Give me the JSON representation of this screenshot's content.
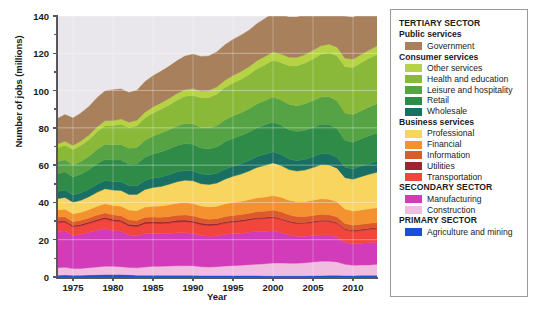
{
  "chart_data": {
    "type": "area",
    "title": "",
    "xlabel": "Year",
    "ylabel": "Number of jobs (millions)",
    "xlim": [
      1973,
      2013
    ],
    "ylim": [
      0,
      140
    ],
    "grid": true,
    "stacked": true,
    "legend_position": "right",
    "y_ticks": [
      0,
      20,
      40,
      60,
      80,
      100,
      120,
      140
    ],
    "y_tick_labels": [
      "0",
      "20",
      "40",
      "60",
      "80",
      "100",
      "120",
      "140"
    ],
    "x_ticks": [
      1975,
      1980,
      1985,
      1990,
      1995,
      2000,
      2005,
      2010
    ],
    "x_tick_labels": [
      "1975",
      "1980",
      "1985",
      "1990",
      "1995",
      "2000",
      "2005",
      "2010"
    ],
    "x": [
      1973,
      1974,
      1975,
      1976,
      1977,
      1978,
      1979,
      1980,
      1981,
      1982,
      1983,
      1984,
      1985,
      1986,
      1987,
      1988,
      1989,
      1990,
      1991,
      1992,
      1993,
      1994,
      1995,
      1996,
      1997,
      1998,
      1999,
      2000,
      2001,
      2002,
      2003,
      2004,
      2005,
      2006,
      2007,
      2008,
      2009,
      2010,
      2011,
      2012,
      2013
    ],
    "stack_order_bottom_to_top": [
      "Agriculture and mining",
      "Construction",
      "Manufacturing",
      "Transportation",
      "Utilities",
      "Information",
      "Financial",
      "Professional",
      "Wholesale",
      "Retail",
      "Leisure and hospitality",
      "Health and education",
      "Other services",
      "Government"
    ],
    "series": [
      {
        "name": "Agriculture and mining",
        "color": "#1c50d2",
        "values": [
          1.0,
          1.1,
          1.0,
          1.0,
          1.1,
          1.2,
          1.3,
          1.3,
          1.3,
          1.2,
          1.0,
          1.0,
          1.0,
          0.9,
          0.9,
          0.9,
          0.9,
          0.9,
          0.8,
          0.8,
          0.8,
          0.8,
          0.8,
          0.8,
          0.8,
          0.8,
          0.7,
          0.7,
          0.7,
          0.7,
          0.7,
          0.7,
          0.8,
          0.8,
          0.9,
          0.9,
          0.8,
          0.8,
          0.9,
          0.9,
          0.9
        ]
      },
      {
        "name": "Construction",
        "color": "#f0bde0",
        "values": [
          4.0,
          4.1,
          3.5,
          3.6,
          3.9,
          4.2,
          4.5,
          4.4,
          4.2,
          3.9,
          3.9,
          4.4,
          4.7,
          4.8,
          5.0,
          5.1,
          5.2,
          5.1,
          4.7,
          4.5,
          4.7,
          5.1,
          5.3,
          5.5,
          5.8,
          6.1,
          6.4,
          6.8,
          6.8,
          6.7,
          6.7,
          6.9,
          7.3,
          7.7,
          7.6,
          7.2,
          6.0,
          5.5,
          5.5,
          5.6,
          5.9
        ]
      },
      {
        "name": "Manufacturing",
        "color": "#d23bba",
        "values": [
          19.4,
          19.5,
          17.8,
          18.3,
          19.0,
          19.7,
          20.2,
          19.3,
          19.0,
          17.4,
          17.2,
          18.0,
          17.8,
          17.5,
          17.5,
          17.8,
          17.8,
          17.4,
          16.8,
          16.5,
          16.6,
          17.0,
          17.2,
          17.2,
          17.4,
          17.6,
          17.3,
          17.3,
          16.4,
          15.3,
          14.5,
          14.3,
          14.2,
          14.2,
          14.0,
          13.4,
          11.8,
          11.5,
          11.7,
          11.9,
          12.0
        ]
      },
      {
        "name": "Transportation",
        "color": "#f2463c",
        "values": [
          4.7,
          4.7,
          4.5,
          4.6,
          4.7,
          4.9,
          5.1,
          5.1,
          5.1,
          4.9,
          4.9,
          5.2,
          5.3,
          5.4,
          5.5,
          5.7,
          5.8,
          5.8,
          5.7,
          5.7,
          5.8,
          6.0,
          6.1,
          6.3,
          6.5,
          6.7,
          6.9,
          7.0,
          6.9,
          6.7,
          6.7,
          6.8,
          7.0,
          7.2,
          7.3,
          7.2,
          6.7,
          6.7,
          6.9,
          7.1,
          7.2
        ]
      },
      {
        "name": "Utilities",
        "color": "#9e2430",
        "values": [
          0.8,
          0.8,
          0.8,
          0.8,
          0.8,
          0.9,
          0.9,
          0.9,
          0.9,
          0.9,
          0.9,
          0.9,
          0.9,
          0.9,
          0.9,
          0.9,
          0.9,
          0.9,
          0.9,
          0.9,
          0.8,
          0.8,
          0.8,
          0.8,
          0.7,
          0.7,
          0.7,
          0.6,
          0.6,
          0.6,
          0.6,
          0.6,
          0.6,
          0.6,
          0.6,
          0.6,
          0.6,
          0.6,
          0.6,
          0.6,
          0.6
        ]
      },
      {
        "name": "Information",
        "color": "#dd5a2c",
        "values": [
          2.1,
          2.1,
          2.1,
          2.1,
          2.2,
          2.3,
          2.4,
          2.4,
          2.4,
          2.4,
          2.4,
          2.5,
          2.5,
          2.5,
          2.6,
          2.7,
          2.7,
          2.7,
          2.7,
          2.6,
          2.6,
          2.7,
          2.8,
          2.9,
          3.0,
          3.2,
          3.3,
          3.6,
          3.6,
          3.4,
          3.2,
          3.1,
          3.1,
          3.1,
          3.0,
          3.0,
          2.8,
          2.7,
          2.7,
          2.7,
          2.7
        ]
      },
      {
        "name": "Financial",
        "color": "#f4922f",
        "values": [
          4.0,
          4.1,
          4.2,
          4.3,
          4.5,
          4.7,
          4.9,
          5.0,
          5.1,
          5.2,
          5.3,
          5.5,
          5.8,
          6.1,
          6.3,
          6.5,
          6.6,
          6.6,
          6.5,
          6.6,
          6.7,
          6.9,
          7.0,
          7.1,
          7.2,
          7.4,
          7.6,
          7.7,
          7.8,
          7.8,
          8.0,
          8.0,
          8.2,
          8.4,
          8.3,
          8.1,
          7.8,
          7.6,
          7.7,
          7.8,
          7.9
        ]
      },
      {
        "name": "Professional",
        "color": "#f8d55e",
        "values": [
          6.0,
          6.3,
          6.2,
          6.5,
          6.9,
          7.5,
          8.0,
          8.2,
          8.4,
          8.4,
          8.7,
          9.4,
          10.0,
          10.5,
          11.0,
          11.5,
          12.0,
          12.2,
          11.9,
          12.0,
          12.4,
          13.2,
          14.0,
          14.6,
          15.4,
          16.3,
          17.0,
          17.5,
          17.0,
          16.4,
          16.4,
          17.0,
          17.5,
          18.2,
          18.4,
          18.0,
          16.8,
          17.0,
          17.8,
          18.5,
          19.0
        ]
      },
      {
        "name": "Wholesale",
        "color": "#1a6f63",
        "values": [
          3.9,
          4.0,
          3.9,
          4.0,
          4.1,
          4.3,
          4.5,
          4.6,
          4.7,
          4.6,
          4.6,
          4.8,
          5.0,
          5.1,
          5.2,
          5.3,
          5.4,
          5.3,
          5.2,
          5.2,
          5.2,
          5.3,
          5.4,
          5.5,
          5.7,
          5.8,
          5.9,
          6.0,
          5.9,
          5.7,
          5.6,
          5.7,
          5.8,
          5.9,
          6.0,
          5.9,
          5.6,
          5.5,
          5.7,
          5.8,
          5.9
        ]
      },
      {
        "name": "Retail",
        "color": "#2f8c48",
        "values": [
          9.5,
          9.7,
          9.6,
          10.0,
          10.4,
          11.0,
          11.4,
          11.5,
          11.6,
          11.6,
          11.9,
          12.5,
          13.0,
          13.5,
          13.8,
          14.1,
          14.3,
          14.3,
          14.0,
          13.9,
          14.2,
          14.7,
          15.0,
          15.2,
          15.3,
          15.5,
          15.8,
          16.0,
          15.8,
          15.7,
          15.6,
          15.6,
          15.7,
          15.8,
          15.7,
          15.3,
          14.5,
          14.4,
          14.6,
          14.8,
          15.0
        ]
      },
      {
        "name": "Leisure and hospitality",
        "color": "#55a344",
        "values": [
          6.3,
          6.5,
          6.6,
          6.9,
          7.2,
          7.7,
          8.0,
          8.2,
          8.4,
          8.5,
          8.8,
          9.2,
          9.6,
          10.0,
          10.3,
          10.5,
          10.8,
          11.0,
          11.0,
          11.2,
          11.5,
          11.8,
          12.1,
          12.2,
          12.5,
          12.8,
          13.1,
          13.4,
          13.5,
          13.6,
          13.9,
          14.2,
          14.5,
          14.7,
          15.0,
          14.9,
          14.6,
          14.8,
          15.1,
          15.5,
          15.8
        ]
      },
      {
        "name": "Health and education",
        "color": "#8ab93a",
        "values": [
          7.5,
          7.8,
          8.2,
          8.6,
          9.0,
          9.5,
          10.0,
          10.4,
          10.8,
          11.2,
          11.6,
          12.0,
          12.4,
          12.9,
          13.3,
          13.9,
          14.5,
          15.2,
          15.9,
          16.4,
          16.9,
          17.3,
          17.6,
          18.0,
          18.3,
          18.8,
          19.2,
          19.6,
          20.1,
          20.8,
          21.4,
          21.9,
          22.3,
          22.9,
          23.5,
          24.2,
          24.8,
          25.3,
          25.7,
          26.1,
          26.5
        ]
      },
      {
        "name": "Other services",
        "color": "#b6d344",
        "values": [
          2.0,
          2.1,
          2.2,
          2.3,
          2.4,
          2.5,
          2.6,
          2.7,
          2.8,
          2.8,
          2.9,
          3.0,
          3.2,
          3.3,
          3.4,
          3.5,
          3.6,
          3.7,
          3.7,
          3.7,
          3.8,
          3.9,
          4.0,
          4.1,
          4.2,
          4.3,
          4.4,
          4.5,
          4.5,
          4.5,
          4.5,
          4.5,
          4.6,
          4.6,
          4.6,
          4.6,
          4.5,
          4.4,
          4.4,
          4.4,
          4.5
        ]
      },
      {
        "name": "Government",
        "color": "#a8805c",
        "values": [
          13.7,
          14.3,
          14.7,
          15.0,
          15.3,
          15.8,
          16.0,
          16.4,
          16.2,
          16.0,
          16.1,
          16.4,
          16.7,
          17.0,
          17.3,
          17.6,
          18.0,
          18.4,
          18.5,
          18.6,
          18.8,
          19.1,
          19.3,
          19.5,
          19.6,
          19.9,
          20.3,
          20.8,
          21.1,
          21.5,
          21.6,
          21.6,
          21.8,
          22.0,
          22.2,
          22.5,
          22.5,
          22.5,
          22.1,
          21.9,
          21.9
        ]
      }
    ]
  },
  "axes": {
    "y_title": "Number of jobs (millions)",
    "x_title": "Year"
  },
  "legend": {
    "groups": [
      {
        "title": "TERTIARY SECTOR",
        "subgroups": [
          {
            "title": "Public services",
            "items": [
              {
                "label": "Government",
                "color": "#a8805c"
              }
            ]
          },
          {
            "title": "Consumer services",
            "items": [
              {
                "label": "Other services",
                "color": "#b6d344"
              },
              {
                "label": "Health and education",
                "color": "#8ab93a"
              },
              {
                "label": "Leisure and hospitality",
                "color": "#55a344"
              },
              {
                "label": "Retail",
                "color": "#2f8c48"
              },
              {
                "label": "Wholesale",
                "color": "#1a6f63"
              }
            ]
          },
          {
            "title": "Business services",
            "items": [
              {
                "label": "Professional",
                "color": "#f8d55e"
              },
              {
                "label": "Financial",
                "color": "#f4922f"
              },
              {
                "label": "Information",
                "color": "#dd5a2c"
              },
              {
                "label": "Utilities",
                "color": "#9e2430"
              },
              {
                "label": "Transportation",
                "color": "#f2463c"
              }
            ]
          }
        ]
      },
      {
        "title": "SECONDARY SECTOR",
        "subgroups": [
          {
            "title": "",
            "items": [
              {
                "label": "Manufacturing",
                "color": "#d23bba"
              },
              {
                "label": "Construction",
                "color": "#f0bde0"
              }
            ]
          }
        ]
      },
      {
        "title": "PRIMARY SECTOR",
        "subgroups": [
          {
            "title": "",
            "items": [
              {
                "label": "Agriculture and mining",
                "color": "#1c50d2"
              }
            ]
          }
        ]
      }
    ]
  },
  "style": {
    "plot_bg": "#e9e7eb",
    "gridline_color": "#ffffff",
    "axis_color": "#58585a",
    "legend_border": "#9a9a9a"
  }
}
